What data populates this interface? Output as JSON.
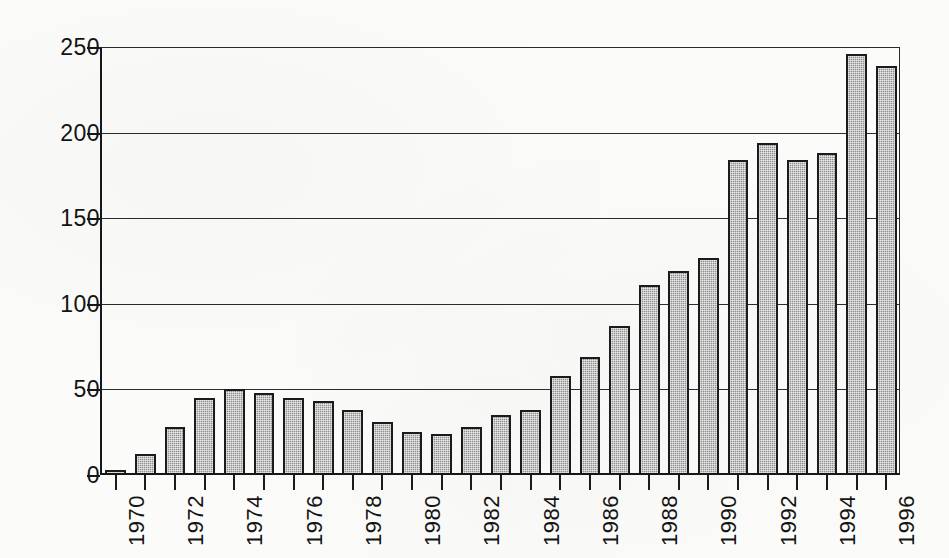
{
  "chart_data": {
    "type": "bar",
    "title": "",
    "subtitle": "",
    "xlabel": "",
    "ylabel": "",
    "categories": [
      "1970",
      "1971",
      "1972",
      "1973",
      "1974",
      "1975",
      "1976",
      "1977",
      "1978",
      "1979",
      "1980",
      "1981",
      "1982",
      "1983",
      "1984",
      "1985",
      "1986",
      "1987",
      "1988",
      "1989",
      "1990",
      "1991",
      "1992",
      "1993",
      "1994",
      "1995",
      "1996"
    ],
    "values": [
      3,
      12,
      28,
      45,
      50,
      48,
      45,
      43,
      38,
      31,
      25,
      24,
      28,
      35,
      38,
      58,
      69,
      87,
      111,
      119,
      127,
      184,
      194,
      184,
      188,
      246,
      239
    ],
    "ylim": [
      0,
      250
    ],
    "ytick_labels": [
      "0",
      "50",
      "100",
      "150",
      "200",
      "250"
    ],
    "ytick_values": [
      0,
      50,
      100,
      150,
      200,
      250
    ],
    "xtick_labels": [
      "1970",
      "1972",
      "1974",
      "1976",
      "1978",
      "1980",
      "1982",
      "1984",
      "1986",
      "1988",
      "1990",
      "1992",
      "1994",
      "1996"
    ],
    "xtick_label_rotation": -90,
    "grid": "horizontal",
    "legend": null,
    "legend_position": "none",
    "bar_fill_color": "#8e8e8e",
    "bar_edge_color": "#1b1b1b",
    "axis_color": "#171717",
    "background_color": "#fbfbf9"
  }
}
